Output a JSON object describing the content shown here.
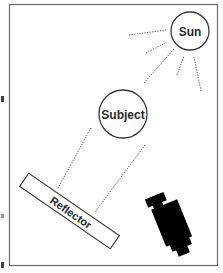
{
  "diagram": {
    "type": "lighting-setup",
    "labels": {
      "sun": "Sun",
      "subject": "Subject",
      "reflector": "Reflector"
    },
    "elements": [
      {
        "id": "sun",
        "shape": "circle",
        "label": "Sun"
      },
      {
        "id": "subject",
        "shape": "circle",
        "label": "Subject"
      },
      {
        "id": "reflector",
        "shape": "rotated-rectangle",
        "label": "Reflector"
      },
      {
        "id": "camera",
        "shape": "camera-silhouette",
        "label": ""
      }
    ],
    "connections": [
      {
        "from": "sun",
        "to": "subject",
        "style": "dotted"
      },
      {
        "from": "subject",
        "to": "reflector",
        "style": "dotted",
        "count": 2
      },
      {
        "from": "sun",
        "to": "rays",
        "style": "dotted",
        "count": 5
      }
    ],
    "colors": {
      "frame": "#6b6b6b",
      "stroke": "#3a3a3a",
      "camera": "#000000",
      "background": "#ffffff"
    }
  }
}
